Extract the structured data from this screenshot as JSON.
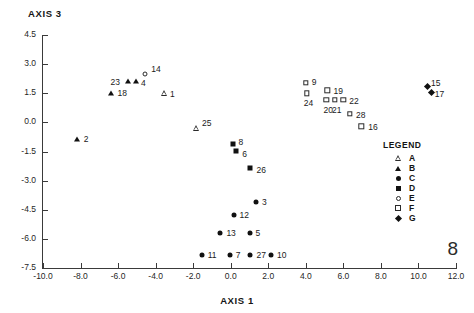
{
  "figure": {
    "number": "8",
    "caption": ""
  },
  "chart_data": {
    "type": "scatter",
    "title": "",
    "xlabel": "AXIS 1",
    "ylabel": "AXIS 3",
    "xlim": [
      -10.0,
      12.0
    ],
    "ylim": [
      -7.5,
      4.5
    ],
    "grid": false,
    "xticks": [
      "-10.0",
      "-8.0",
      "-6.0",
      "-4.0",
      "-2.0",
      "0.0",
      "2.0",
      "4.0",
      "6.0",
      "8.0",
      "10.0",
      "12.0"
    ],
    "xtickvals": [
      -10.0,
      -8.0,
      -6.0,
      -4.0,
      -2.0,
      0.0,
      2.0,
      4.0,
      6.0,
      8.0,
      10.0,
      12.0
    ],
    "yticks": [
      "4.5",
      "3.0",
      "1.5",
      "0.0",
      "-1.5",
      "-3.0",
      "-4.5",
      "-6.0",
      "-7.5"
    ],
    "ytickvals": [
      4.5,
      3.0,
      1.5,
      0.0,
      -1.5,
      -3.0,
      -4.5,
      -6.0,
      -7.5
    ],
    "legend_title": "LEGEND",
    "legend_position": "right",
    "series": [
      {
        "name": "A",
        "marker": "triangle-open"
      },
      {
        "name": "B",
        "marker": "triangle-filled"
      },
      {
        "name": "C",
        "marker": "circle-filled"
      },
      {
        "name": "D",
        "marker": "square-filled"
      },
      {
        "name": "E",
        "marker": "circle-open"
      },
      {
        "name": "F",
        "marker": "square-open"
      },
      {
        "name": "G",
        "marker": "diamond-filled"
      }
    ],
    "points": [
      {
        "label": "2",
        "group": "B",
        "x": -8.2,
        "y": -0.85,
        "lx": 7,
        "ly": 0
      },
      {
        "label": "18",
        "group": "B",
        "x": -6.4,
        "y": 1.5,
        "lx": 7,
        "ly": 0
      },
      {
        "label": "23",
        "group": "B",
        "x": -5.45,
        "y": 2.15,
        "lx": -18,
        "ly": 1
      },
      {
        "label": "4",
        "group": "B",
        "x": -5.05,
        "y": 2.15,
        "lx": 5,
        "ly": 2
      },
      {
        "label": "14",
        "group": "E",
        "x": -4.55,
        "y": 2.5,
        "lx": 6,
        "ly": -5
      },
      {
        "label": "1",
        "group": "A",
        "x": -3.55,
        "y": 1.5,
        "lx": 6,
        "ly": 1
      },
      {
        "label": "25",
        "group": "A",
        "x": -1.85,
        "y": 0.0,
        "lx": 6,
        "ly": 1
      },
      {
        "label": "8",
        "group": "D",
        "x": 0.1,
        "y": -1.1,
        "lx": 6,
        "ly": -2
      },
      {
        "label": "6",
        "group": "D",
        "x": 0.3,
        "y": -1.45,
        "lx": 6,
        "ly": 3
      },
      {
        "label": "26",
        "group": "D",
        "x": 1.05,
        "y": -2.35,
        "lx": 6,
        "ly": 2
      },
      {
        "label": "3",
        "group": "C",
        "x": 1.35,
        "y": -4.1,
        "lx": 6,
        "ly": 0
      },
      {
        "label": "12",
        "group": "C",
        "x": 0.15,
        "y": -4.75,
        "lx": 6,
        "ly": 0
      },
      {
        "label": "13",
        "group": "C",
        "x": -0.55,
        "y": -5.7,
        "lx": 6,
        "ly": 0
      },
      {
        "label": "5",
        "group": "C",
        "x": 1.0,
        "y": -5.7,
        "lx": 6,
        "ly": 0
      },
      {
        "label": "11",
        "group": "C",
        "x": -1.55,
        "y": -6.85,
        "lx": 6,
        "ly": 0
      },
      {
        "label": "7",
        "group": "C",
        "x": -0.05,
        "y": -6.85,
        "lx": 6,
        "ly": 0
      },
      {
        "label": "27",
        "group": "C",
        "x": 1.05,
        "y": -6.85,
        "lx": 6,
        "ly": 0
      },
      {
        "label": "10",
        "group": "C",
        "x": 2.15,
        "y": -6.85,
        "lx": 6,
        "ly": 0
      },
      {
        "label": "9",
        "group": "F",
        "x": 4.0,
        "y": 2.05,
        "lx": 6,
        "ly": -1
      },
      {
        "label": "24",
        "group": "F",
        "x": 4.05,
        "y": 1.5,
        "lx": -3,
        "ly": 10
      },
      {
        "label": "19",
        "group": "F",
        "x": 5.15,
        "y": 1.65,
        "lx": 6,
        "ly": 1
      },
      {
        "label": "20",
        "group": "F",
        "x": 5.1,
        "y": 1.15,
        "lx": -3,
        "ly": 10
      },
      {
        "label": "21",
        "group": "F",
        "x": 5.55,
        "y": 1.15,
        "lx": -3,
        "ly": 10
      },
      {
        "label": "22",
        "group": "F",
        "x": 6.0,
        "y": 1.15,
        "lx": 6,
        "ly": 1
      },
      {
        "label": "28",
        "group": "F",
        "x": 6.35,
        "y": 0.45,
        "lx": 6,
        "ly": 1
      },
      {
        "label": "16",
        "group": "F",
        "x": 6.95,
        "y": -0.2,
        "lx": 7,
        "ly": 1
      },
      {
        "label": "15",
        "group": "G",
        "x": 10.35,
        "y": 2.0,
        "lx": 6,
        "ly": -1
      },
      {
        "label": "17",
        "group": "G",
        "x": 10.55,
        "y": 1.65,
        "lx": 6,
        "ly": 4
      }
    ]
  }
}
